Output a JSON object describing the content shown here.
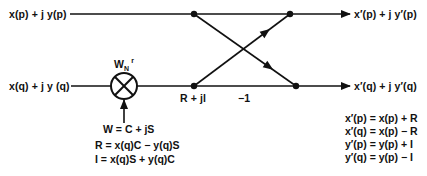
{
  "diagram": {
    "type": "FFT butterfly signal flow graph",
    "inputs": {
      "top": "x(p) + j y(p)",
      "bottom": "x(q) + j y (q)"
    },
    "outputs": {
      "top": "x′(p) + j y′(p)",
      "bottom": "x′(q) + j y′(q)"
    },
    "twiddle": {
      "base": "W",
      "subscript": "N",
      "superscript": "r",
      "multiplier_symbol": "⊗"
    },
    "product_label": "R + jl",
    "branch_gain": "−1",
    "twiddle_definition": "W = C + jS",
    "product_equations": [
      "R = x(q)C − y(q)S",
      "I  = x(q)S + y(q)C"
    ],
    "output_equations": [
      "x′(p) = x(p) + R",
      "x′(q) = x(p) − R",
      "y′(p) = y(p) + I",
      "y′(q) = y(p) − I"
    ]
  }
}
